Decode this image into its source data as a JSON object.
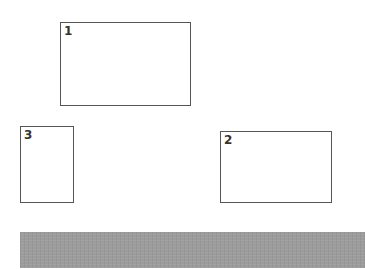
{
  "boxes": [
    {
      "label": "1",
      "x": 60,
      "y": 22,
      "w": 131,
      "h": 84
    },
    {
      "label": "2",
      "x": 220,
      "y": 131,
      "w": 112,
      "h": 72
    },
    {
      "label": "3",
      "x": 20,
      "y": 126,
      "w": 54,
      "h": 77
    }
  ],
  "bar": {
    "color": "#9c9c9c",
    "x": 20,
    "y": 232,
    "w": 345,
    "h": 36
  },
  "colors": {
    "border": "#555555",
    "label": "#333333",
    "background": "#ffffff"
  }
}
